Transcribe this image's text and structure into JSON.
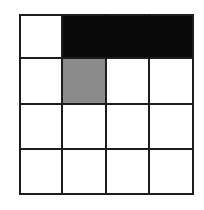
{
  "figure": {
    "name": "shaded-grid-figure",
    "rows": 4,
    "columns": 4,
    "background_color": "#ffffff",
    "line_color": "#1d1d1d",
    "line_width_px": 2,
    "colors": {
      "black": "#0a0a0a",
      "gray": "#8b8b8b",
      "white": "#ffffff"
    },
    "shaded_counts": {
      "black": 3,
      "gray": 1,
      "white": 12
    },
    "cells": [
      {
        "row": 1,
        "col": 1,
        "fill": "white"
      },
      {
        "row": 1,
        "col": 2,
        "fill": "black"
      },
      {
        "row": 1,
        "col": 3,
        "fill": "black"
      },
      {
        "row": 1,
        "col": 4,
        "fill": "black"
      },
      {
        "row": 2,
        "col": 1,
        "fill": "white"
      },
      {
        "row": 2,
        "col": 2,
        "fill": "gray"
      },
      {
        "row": 2,
        "col": 3,
        "fill": "white"
      },
      {
        "row": 2,
        "col": 4,
        "fill": "white"
      },
      {
        "row": 3,
        "col": 1,
        "fill": "white"
      },
      {
        "row": 3,
        "col": 2,
        "fill": "white"
      },
      {
        "row": 3,
        "col": 3,
        "fill": "white"
      },
      {
        "row": 3,
        "col": 4,
        "fill": "white"
      },
      {
        "row": 4,
        "col": 1,
        "fill": "white"
      },
      {
        "row": 4,
        "col": 2,
        "fill": "white"
      },
      {
        "row": 4,
        "col": 3,
        "fill": "white"
      },
      {
        "row": 4,
        "col": 4,
        "fill": "white"
      }
    ]
  }
}
